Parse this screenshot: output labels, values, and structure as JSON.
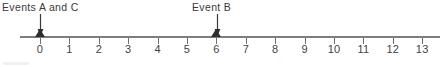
{
  "figure": {
    "title_visible": false,
    "bottom_artifact": ""
  },
  "labels": {
    "events_a_and_c": "Events A and C",
    "event_b": "Event B"
  },
  "chart_data": {
    "type": "line",
    "subtype": "number-line-timeline",
    "title": "",
    "xlabel": "",
    "ylabel": "",
    "xlim": [
      0,
      13
    ],
    "grid": false,
    "legend_position": "none",
    "tick_labels": [
      "0",
      "1",
      "2",
      "3",
      "4",
      "5",
      "6",
      "7",
      "8",
      "9",
      "10",
      "11",
      "12",
      "13"
    ],
    "tick_values": [
      0,
      1,
      2,
      3,
      4,
      5,
      6,
      7,
      8,
      9,
      10,
      11,
      12,
      13
    ],
    "axis_color": "#7e7e7e",
    "marker_color": "#2e2e2e",
    "text_color": "#3a3a3a",
    "background_color": "#ffffff",
    "annotations": [
      {
        "label": "Events A and C",
        "x": 0,
        "marker": "filled-triangle",
        "arrow": "down"
      },
      {
        "label": "Event B",
        "x": 6,
        "marker": "filled-triangle",
        "arrow": "down"
      }
    ],
    "series": [
      {
        "name": "events",
        "x": [
          0,
          6
        ],
        "labels": [
          "Events A and C",
          "Event B"
        ]
      }
    ]
  }
}
